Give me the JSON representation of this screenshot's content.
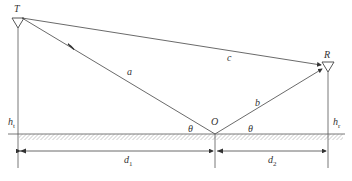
{
  "diagram": {
    "labels": {
      "transmitter": "T",
      "receiver": "R",
      "reflection_point": "O",
      "reflected_incident_path": "a",
      "reflected_path": "b",
      "direct_path": "c",
      "angle_left": "θ",
      "angle_right": "θ",
      "tx_height": "h",
      "tx_height_sub": "t",
      "rx_height": "h",
      "rx_height_sub": "r",
      "distance_1": "d",
      "distance_1_sub": "1",
      "distance_2": "d",
      "distance_2_sub": "2"
    },
    "colors": {
      "line": "#444444",
      "hatch": "#666666",
      "background": "#ffffff"
    }
  }
}
